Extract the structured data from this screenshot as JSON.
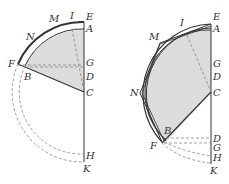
{
  "colors": {
    "line": "#333333",
    "shade": "#dcdcdc",
    "dash": "#888888"
  },
  "left_figure": {
    "labels": {
      "E": "E",
      "A": "A",
      "G": "G",
      "D": "D",
      "C": "C",
      "H": "H",
      "K": "K",
      "F": "F",
      "B": "B",
      "N": "N",
      "M": "M",
      "I": "I"
    }
  },
  "right_figure": {
    "labels": {
      "E": "E",
      "A": "A",
      "G": "G",
      "D": "D",
      "C": "C",
      "D2": "D",
      "G2": "G",
      "H": "H",
      "K": "K",
      "F": "F",
      "B": "B",
      "N": "N",
      "M": "M",
      "I": "I"
    }
  }
}
